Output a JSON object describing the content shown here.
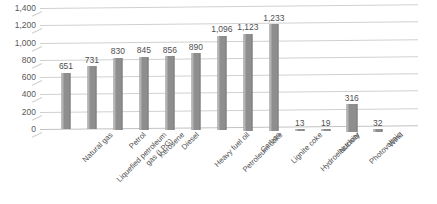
{
  "chart_data": {
    "type": "bar",
    "title": "",
    "subtitle": "",
    "xlabel": "",
    "ylabel": "",
    "ylim": [
      0,
      1400
    ],
    "ytick_step": 200,
    "yticks": [
      "1,400",
      "1,200",
      "1,000",
      "800",
      "600",
      "400",
      "200",
      "0"
    ],
    "ytick_values": [
      1400,
      1200,
      1000,
      800,
      600,
      400,
      200,
      0
    ],
    "grid": true,
    "legend": "none",
    "series_name": "",
    "bar_color": "#8e8e8e",
    "bar_highlight_color": "#b4b4b4",
    "gridline_color": "#d0d0d0",
    "background_color": "#ffffff",
    "categories": [
      "Natural gas",
      "Liquefied petroleum\ngas (LPG)",
      "Petrol",
      "Kerosene",
      "Diesel",
      "Heavy fuel oil",
      "Petroleum coke",
      "Carbon",
      "Lignite coke",
      "Hydroelectricity",
      "Nuclear",
      "Photovoltaic",
      "Wind"
    ],
    "values": [
      651,
      731,
      830,
      845,
      856,
      890,
      1096,
      1123,
      1233,
      13,
      19,
      316,
      32
    ],
    "value_labels": [
      "651",
      "731",
      "830",
      "845",
      "856",
      "890",
      "1,096",
      "1,123",
      "1,233",
      "13",
      "19",
      "316",
      "32"
    ]
  }
}
